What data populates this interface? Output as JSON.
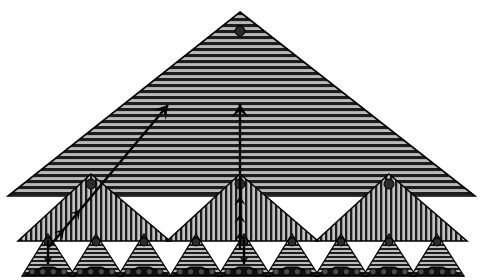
{
  "figure": {
    "canvas": {
      "width": 483,
      "height": 280,
      "background": "#ffffff"
    },
    "colors": {
      "outline": "#000000",
      "fill_light": "#b4b4b4",
      "fill_mid": "#9a9a9a",
      "hatch_dark": "#1a1a1a",
      "node_dot": "#2b2b2b",
      "arrow": "#000000",
      "base_band": "#111111",
      "base_circle": "#4a4a4a"
    },
    "levels": [
      {
        "name": "level-1-root",
        "count": 1,
        "hatch": "horizontal",
        "label": "root triangle"
      },
      {
        "name": "level-2-branch",
        "count": 3,
        "hatch": "vertical",
        "label": "branch triangle"
      },
      {
        "name": "level-3-leaf",
        "count": 9,
        "hatch": "horizontal",
        "label": "leaf triangle"
      }
    ]
  },
  "root": {
    "name": "root-triangle",
    "apex_x": 240,
    "apex_y": 12,
    "left_x": 8,
    "right_x": 475,
    "base_y": 196,
    "hatch": "horizontal",
    "hatch_pitch": 6,
    "node_dot": {
      "cx": 240,
      "cy": 31,
      "r": 5
    }
  },
  "branches": [
    {
      "name": "branch-triangle-1",
      "apex_x": 91,
      "apex_y": 174,
      "left_x": 18,
      "right_x": 170,
      "base_y": 241,
      "node_dot": {
        "cx": 91,
        "cy": 184,
        "r": 5
      }
    },
    {
      "name": "branch-triangle-2",
      "apex_x": 240,
      "apex_y": 174,
      "left_x": 167,
      "right_x": 318,
      "base_y": 241,
      "node_dot": {
        "cx": 240,
        "cy": 184,
        "r": 5
      }
    },
    {
      "name": "branch-triangle-3",
      "apex_x": 389,
      "apex_y": 174,
      "left_x": 316,
      "right_x": 467,
      "base_y": 241,
      "node_dot": {
        "cx": 389,
        "cy": 184,
        "r": 5
      }
    }
  ],
  "leaves": [
    {
      "name": "leaf-triangle-1",
      "apex_x": 48,
      "apex_y": 234,
      "left_x": 22,
      "right_x": 75,
      "base_y": 276,
      "node_dot": {
        "cx": 48,
        "cy": 242,
        "r": 4
      },
      "base_circles": 4
    },
    {
      "name": "leaf-triangle-2",
      "apex_x": 96,
      "apex_y": 234,
      "left_x": 70,
      "right_x": 123,
      "base_y": 276,
      "node_dot": {
        "cx": 96,
        "cy": 242,
        "r": 4
      },
      "base_circles": 4
    },
    {
      "name": "leaf-triangle-3",
      "apex_x": 144,
      "apex_y": 234,
      "left_x": 118,
      "right_x": 171,
      "base_y": 276,
      "node_dot": {
        "cx": 144,
        "cy": 242,
        "r": 4
      },
      "base_circles": 4
    },
    {
      "name": "leaf-triangle-4",
      "apex_x": 196,
      "apex_y": 234,
      "left_x": 170,
      "right_x": 223,
      "base_y": 276,
      "node_dot": {
        "cx": 196,
        "cy": 242,
        "r": 4
      },
      "base_circles": 4
    },
    {
      "name": "leaf-triangle-5",
      "apex_x": 244,
      "apex_y": 234,
      "left_x": 218,
      "right_x": 271,
      "base_y": 276,
      "node_dot": {
        "cx": 244,
        "cy": 242,
        "r": 4
      },
      "base_circles": 4
    },
    {
      "name": "leaf-triangle-6",
      "apex_x": 292,
      "apex_y": 234,
      "left_x": 266,
      "right_x": 319,
      "base_y": 276,
      "node_dot": {
        "cx": 292,
        "cy": 242,
        "r": 4
      },
      "base_circles": 4
    },
    {
      "name": "leaf-triangle-7",
      "apex_x": 341,
      "apex_y": 234,
      "left_x": 315,
      "right_x": 368,
      "base_y": 276,
      "node_dot": {
        "cx": 341,
        "cy": 242,
        "r": 4
      },
      "base_circles": 4
    },
    {
      "name": "leaf-triangle-8",
      "apex_x": 389,
      "apex_y": 234,
      "left_x": 363,
      "right_x": 416,
      "base_y": 276,
      "node_dot": {
        "cx": 389,
        "cy": 242,
        "r": 4
      },
      "base_circles": 4
    },
    {
      "name": "leaf-triangle-9",
      "apex_x": 437,
      "apex_y": 234,
      "left_x": 411,
      "right_x": 464,
      "base_y": 276,
      "node_dot": {
        "cx": 437,
        "cy": 242,
        "r": 4
      },
      "base_circles": 4
    }
  ],
  "arrows": [
    {
      "name": "diagonal-upward-arrow",
      "direction": "up-right",
      "from_x": 49,
      "from_y": 247,
      "to_x": 168,
      "to_y": 105,
      "heads": [
        {
          "x": 168,
          "y": 105,
          "size": 13
        },
        {
          "x": 80,
          "y": 210,
          "size": 9
        },
        {
          "x": 64,
          "y": 229,
          "size": 9
        }
      ]
    },
    {
      "name": "vertical-upward-arrow",
      "direction": "up",
      "from_x": 240,
      "from_y": 250,
      "to_x": 240,
      "to_y": 104,
      "heads": [
        {
          "x": 240,
          "y": 104,
          "size": 13
        },
        {
          "x": 240,
          "y": 196,
          "size": 9
        },
        {
          "x": 240,
          "y": 214,
          "size": 9
        },
        {
          "x": 240,
          "y": 232,
          "size": 9
        }
      ]
    },
    {
      "name": "leaf-down-arrow-left",
      "direction": "down",
      "from_x": 48,
      "from_y": 240,
      "to_x": 48,
      "to_y": 264,
      "heads": [
        {
          "x": 48,
          "y": 264,
          "size": 8
        }
      ]
    },
    {
      "name": "leaf-down-arrow-center",
      "direction": "down",
      "from_x": 244,
      "from_y": 240,
      "to_x": 244,
      "to_y": 264,
      "heads": [
        {
          "x": 244,
          "y": 264,
          "size": 8
        }
      ]
    }
  ]
}
